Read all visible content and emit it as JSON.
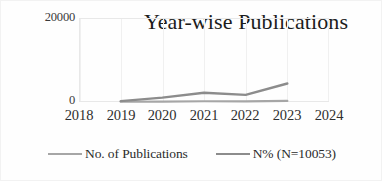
{
  "chart_data": {
    "type": "line",
    "title": "Year-wise Publications",
    "xlabel": "",
    "ylabel": "",
    "categories": [
      "2018",
      "2019",
      "2020",
      "2021",
      "2022",
      "2023",
      "2024"
    ],
    "x": [
      2018,
      2019,
      2020,
      2021,
      2022,
      2023,
      2024
    ],
    "xlim": [
      2018,
      2024
    ],
    "ylim": [
      0,
      20000
    ],
    "yticks": [
      "0",
      "20000"
    ],
    "ytick_values": [
      0,
      20000
    ],
    "grid": "vertical",
    "legend_position": "bottom",
    "series": [
      {
        "name": "No. of Publications",
        "color": "#a6a6a6",
        "x": [
          2019,
          2020,
          2021,
          2022,
          2023
        ],
        "values": [
          60,
          110,
          180,
          150,
          260
        ]
      },
      {
        "name": "N% (N=10053)",
        "color": "#8c8c8c",
        "x": [
          2019,
          2020,
          2021,
          2022,
          2023
        ],
        "values": [
          200,
          1050,
          2200,
          1700,
          4400
        ]
      }
    ],
    "annotations": []
  },
  "axis": {
    "y_top_label": "20000",
    "y_zero_label": "0"
  },
  "legend": {
    "items": [
      {
        "label": "No. of Publications",
        "color": "#a6a6a6"
      },
      {
        "label": "N% (N=10053)",
        "color": "#8c8c8c"
      }
    ]
  }
}
